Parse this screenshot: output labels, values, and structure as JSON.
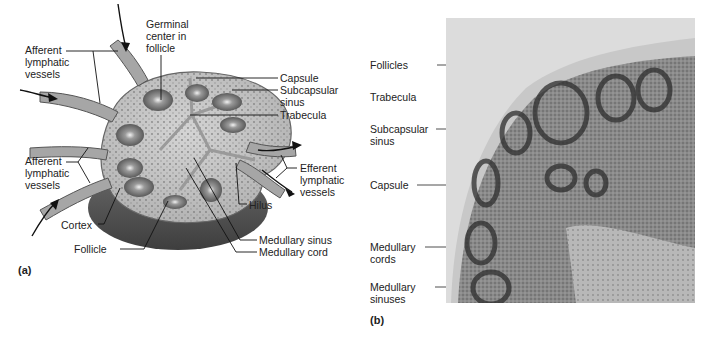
{
  "panel_a": {
    "tag": "(a)",
    "labels": {
      "afferent_top": "Afferent\nlymphatic\nvessels",
      "germinal": "Germinal\ncenter in\nfollicle",
      "capsule": "Capsule",
      "subcapsular": "Subcapsular\nsinus",
      "trabecula": "Trabecula",
      "afferent_bottom": "Afferent\nlymphatic\nvessels",
      "efferent": "Efferent\nlymphatic\nvessels",
      "hilus": "Hilus",
      "cortex": "Cortex",
      "follicle": "Follicle",
      "medullary_sinus": "Medullary sinus",
      "medullary_cord": "Medullary cord"
    }
  },
  "panel_b": {
    "tag": "(b)",
    "labels": {
      "follicles": "Follicles",
      "trabecula": "Trabecula",
      "subcapsular": "Subcapsular\nsinus",
      "capsule": "Capsule",
      "medullary_cords": "Medullary\ncords",
      "medullary_sinuses": "Medullary\nsinuses"
    }
  }
}
